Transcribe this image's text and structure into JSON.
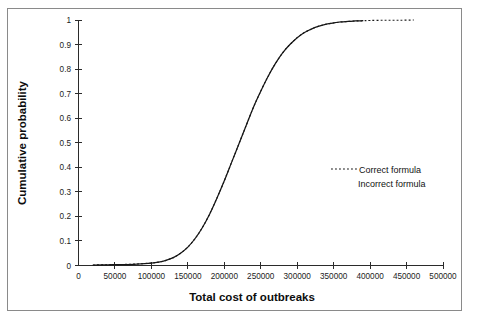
{
  "chart_data": {
    "type": "line",
    "title": "",
    "xlabel": "Total cost of outbreaks",
    "ylabel": "Cumulative probability",
    "xlim": [
      0,
      500000
    ],
    "ylim": [
      0,
      1
    ],
    "grid": false,
    "legend_position": "center-right",
    "x_ticks": [
      0,
      50000,
      100000,
      150000,
      200000,
      250000,
      300000,
      350000,
      400000,
      450000,
      500000
    ],
    "x_tick_labels": [
      "0",
      "50000",
      "100000",
      "150000",
      "200000",
      "250000",
      "300000",
      "350000",
      "400000",
      "450000",
      "500000"
    ],
    "y_ticks": [
      0,
      0.1,
      0.2,
      0.3,
      0.4,
      0.5,
      0.6,
      0.7,
      0.8,
      0.9,
      1
    ],
    "y_tick_labels": [
      "0",
      "0.1",
      "0.2",
      "0.3",
      "0.4",
      "0.5",
      "0.6",
      "0.7",
      "0.8",
      "0.9",
      "1"
    ],
    "series": [
      {
        "name": "Correct formula",
        "style": "dotted",
        "color": "#1a1a1a",
        "x": [
          20000,
          40000,
          60000,
          80000,
          100000,
          110000,
          120000,
          130000,
          140000,
          150000,
          160000,
          170000,
          180000,
          190000,
          200000,
          210000,
          220000,
          230000,
          240000,
          250000,
          260000,
          270000,
          280000,
          290000,
          300000,
          310000,
          320000,
          330000,
          340000,
          350000,
          360000,
          370000,
          380000,
          390000,
          400000,
          420000,
          440000,
          460000
        ],
        "y": [
          0.002,
          0.003,
          0.004,
          0.006,
          0.01,
          0.014,
          0.021,
          0.032,
          0.05,
          0.075,
          0.11,
          0.155,
          0.21,
          0.275,
          0.345,
          0.42,
          0.495,
          0.57,
          0.645,
          0.71,
          0.77,
          0.822,
          0.866,
          0.9,
          0.928,
          0.949,
          0.964,
          0.975,
          0.983,
          0.988,
          0.992,
          0.994,
          0.996,
          0.997,
          0.998,
          0.999,
          0.999,
          1.0
        ]
      },
      {
        "name": "Incorrect formula",
        "style": "solid",
        "color": "#161616",
        "x": [
          20000,
          40000,
          60000,
          80000,
          100000,
          110000,
          120000,
          130000,
          140000,
          150000,
          160000,
          170000,
          180000,
          190000,
          200000,
          210000,
          220000,
          230000,
          240000,
          250000,
          260000,
          270000,
          280000,
          290000,
          300000,
          310000,
          320000,
          330000,
          340000,
          350000,
          360000,
          370000,
          380000,
          390000
        ],
        "y": [
          0.002,
          0.003,
          0.004,
          0.006,
          0.01,
          0.014,
          0.021,
          0.032,
          0.05,
          0.075,
          0.11,
          0.155,
          0.21,
          0.275,
          0.345,
          0.42,
          0.495,
          0.57,
          0.645,
          0.71,
          0.77,
          0.822,
          0.866,
          0.9,
          0.928,
          0.949,
          0.964,
          0.975,
          0.983,
          0.988,
          0.992,
          0.994,
          0.996,
          0.997
        ]
      }
    ]
  },
  "legend": {
    "entries": [
      {
        "label": "Correct formula",
        "style": "dotted"
      },
      {
        "label": "Incorrect formula",
        "style": "solid"
      }
    ]
  }
}
